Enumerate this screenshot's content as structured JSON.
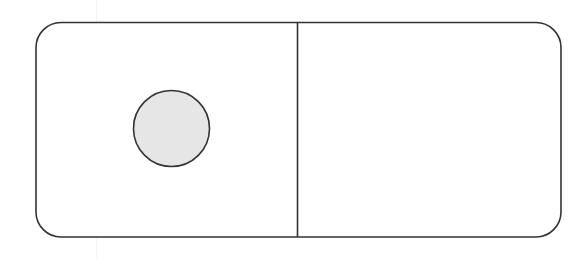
{
  "domino": {
    "left_half": {
      "pips": 1
    },
    "right_half": {
      "pips": 0
    },
    "label": "domino tile 1|0"
  },
  "colors": {
    "outline": "#333333",
    "tile_fill": "#ffffff",
    "pip_fill": "#e6e6e6"
  }
}
